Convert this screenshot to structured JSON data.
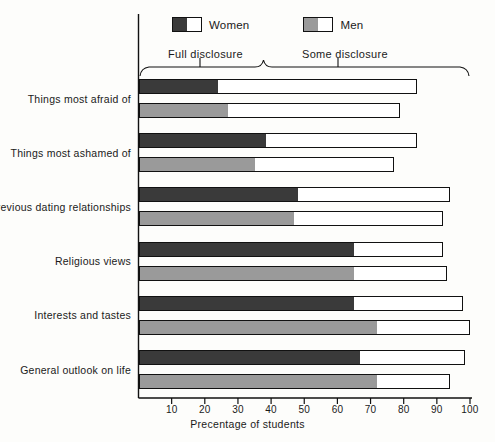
{
  "chart_data": {
    "type": "bar",
    "orientation": "horizontal",
    "title": "",
    "xlabel": "Precentage of students",
    "ylabel": "",
    "xlim": [
      0,
      100
    ],
    "xticks": [
      10,
      20,
      30,
      40,
      50,
      60,
      70,
      80,
      90,
      100
    ],
    "grid": false,
    "legend": {
      "position": "top-left",
      "entries": [
        {
          "name": "Women",
          "fill": "#3a3a3a"
        },
        {
          "name": "Men",
          "fill": "#9a9a9a"
        }
      ]
    },
    "annotations": [
      {
        "text": "Full disclosure",
        "bracket_from": 0,
        "bracket_to": 38
      },
      {
        "text": "Some disclosure",
        "bracket_from": 38,
        "bracket_to": 100
      }
    ],
    "categories": [
      "Things most afraid of",
      "Things most ashamed of",
      "Previous dating relationships",
      "Religious views",
      "Interests and tastes",
      "General outlook on life"
    ],
    "series": [
      {
        "name": "Women",
        "fill": "#3a3a3a",
        "full_disclosure": [
          24,
          38.5,
          48,
          65,
          65,
          67
        ],
        "total_disclosure": [
          84,
          84,
          94,
          92,
          98,
          98.5
        ]
      },
      {
        "name": "Men",
        "fill": "#9a9a9a",
        "full_disclosure": [
          27,
          35,
          47,
          65,
          72,
          72
        ],
        "total_disclosure": [
          79,
          77,
          92,
          93,
          100,
          94
        ]
      }
    ]
  },
  "colors": {
    "women": "#3a3a3a",
    "men": "#9a9a9a",
    "outline": "#111111",
    "background": "#fdfdfb"
  }
}
